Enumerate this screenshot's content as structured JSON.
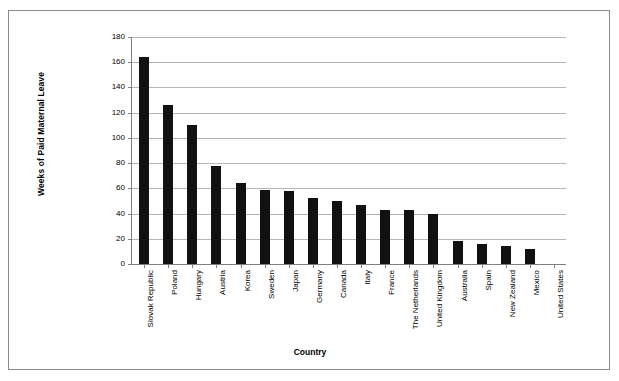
{
  "chart_data": {
    "type": "bar",
    "title": "",
    "subtitle": "",
    "xlabel": "Country",
    "ylabel": "Weeks of Paid Maternal Leave",
    "ylim": [
      0,
      180
    ],
    "ytick_step": 20,
    "yticks": [
      0,
      20,
      40,
      60,
      80,
      100,
      120,
      140,
      160,
      180
    ],
    "ytick_labels": [
      "0",
      "20",
      "40",
      "60",
      "80",
      "100",
      "120",
      "140",
      "160",
      "180"
    ],
    "grid": true,
    "grid_axis": "y",
    "legend": false,
    "legend_position": "none",
    "bar_color": "#111111",
    "plot_background": "#ffffff",
    "frame_border_color": "#8a8a8a",
    "categories": [
      "Slovak Republic",
      "Poland",
      "Hungary",
      "Austria",
      "Korea",
      "Sweden",
      "Japan",
      "Germany",
      "Canada",
      "Italy",
      "France",
      "The Netherlands",
      "United Kingdom",
      "Australia",
      "Spain",
      "New Zealand",
      "Mexico",
      "United States"
    ],
    "values": [
      164,
      126,
      110,
      78,
      64,
      59,
      58,
      52,
      50,
      47,
      43,
      43,
      40,
      18,
      16,
      14,
      12,
      0
    ]
  }
}
